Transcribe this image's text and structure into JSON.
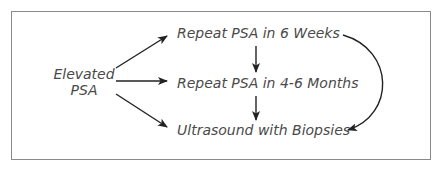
{
  "diagram": {
    "start_node": {
      "line1": "Elevated",
      "line2": "PSA"
    },
    "nodes": [
      {
        "id": "repeat-6-weeks",
        "label": "Repeat PSA in 6 Weeks"
      },
      {
        "id": "repeat-4-6-months",
        "label": "Repeat PSA in 4-6 Months"
      },
      {
        "id": "ultrasound-biopsies",
        "label": "Ultrasound with Biopsies"
      }
    ],
    "edges": [
      {
        "from": "elevated-psa",
        "to": "repeat-6-weeks"
      },
      {
        "from": "elevated-psa",
        "to": "repeat-4-6-months"
      },
      {
        "from": "elevated-psa",
        "to": "ultrasound-biopsies"
      },
      {
        "from": "repeat-6-weeks",
        "to": "repeat-4-6-months"
      },
      {
        "from": "repeat-4-6-months",
        "to": "ultrasound-biopsies"
      },
      {
        "from": "repeat-6-weeks",
        "to": "ultrasound-biopsies",
        "style": "curved"
      }
    ],
    "colors": {
      "border": "#8a8a8a",
      "text": "#4a4a4a",
      "arrow": "#222222"
    }
  }
}
